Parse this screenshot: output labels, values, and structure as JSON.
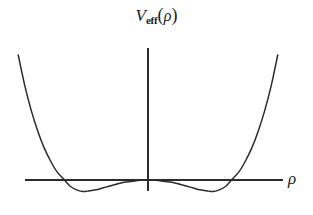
{
  "figure": {
    "title_parts": {
      "symbol": "V",
      "subscript": "eff",
      "open_paren": "(",
      "argument": "ρ",
      "close_paren": ")"
    },
    "title_text": "V_eff(ρ)",
    "x_axis_label": "ρ",
    "line_color": "#2b2b2b",
    "background_color": "#ffffff"
  },
  "chart_data": {
    "type": "line",
    "xlabel": "ρ",
    "ylabel": "V_eff(ρ)",
    "grid": false,
    "legend": null,
    "axis_style": "origin-centered cross, unlabeled ticks",
    "xlim": [
      -2.05,
      2.05
    ],
    "ylim": [
      -0.22,
      1.45
    ],
    "axis_pixels": {
      "x_axis_y": 180,
      "y_axis_x": 148,
      "x_axis_from": 25,
      "x_axis_to": 283,
      "y_axis_from": 48,
      "y_axis_to": 191
    },
    "features": {
      "local_maximum": {
        "x": 0.0,
        "y": 0.0
      },
      "minima": [
        {
          "x": -1.0,
          "y": -0.13
        },
        {
          "x": 1.0,
          "y": -0.13
        }
      ],
      "zero_crossings": [
        -1.41,
        0.0,
        1.41
      ],
      "branch_endpoints": [
        {
          "x": -2.0,
          "y": 1.4
        },
        {
          "x": 2.0,
          "y": 1.4
        }
      ]
    },
    "x": [
      -2.0,
      -1.9,
      -1.8,
      -1.7,
      -1.6,
      -1.5,
      -1.41,
      -1.3,
      -1.2,
      -1.1,
      -1.0,
      -0.9,
      -0.8,
      -0.7,
      -0.6,
      -0.5,
      -0.4,
      -0.3,
      -0.2,
      -0.1,
      0.0,
      0.1,
      0.2,
      0.3,
      0.4,
      0.5,
      0.6,
      0.7,
      0.8,
      0.9,
      1.0,
      1.1,
      1.2,
      1.3,
      1.41,
      1.5,
      1.6,
      1.7,
      1.8,
      1.9,
      2.0
    ],
    "y": [
      1.4,
      1.06,
      0.78,
      0.55,
      0.36,
      0.21,
      0.1,
      0.01,
      -0.07,
      -0.11,
      -0.13,
      -0.12,
      -0.11,
      -0.09,
      -0.07,
      -0.05,
      -0.03,
      -0.02,
      -0.01,
      0.0,
      0.0,
      0.0,
      -0.01,
      -0.02,
      -0.03,
      -0.05,
      -0.07,
      -0.09,
      -0.11,
      -0.12,
      -0.13,
      -0.11,
      -0.07,
      0.01,
      0.1,
      0.21,
      0.36,
      0.55,
      0.78,
      1.06,
      1.4
    ],
    "series": [
      {
        "name": "V_eff(ρ)",
        "formula": "quartic double well",
        "color": "#2b2b2b",
        "style": "solid"
      }
    ]
  }
}
